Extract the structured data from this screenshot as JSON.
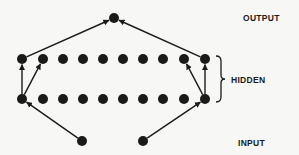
{
  "diagram": {
    "type": "neural-network",
    "labels": {
      "output": "OUTPUT",
      "hidden": "HIDDEN",
      "input": "INPUT"
    },
    "layers": [
      {
        "name": "output",
        "nodes": [
          [
            114,
            18
          ]
        ]
      },
      {
        "name": "hidden-top",
        "nodes": [
          [
            22,
            59
          ],
          [
            43,
            59
          ],
          [
            63,
            59
          ],
          [
            83,
            59
          ],
          [
            103,
            59
          ],
          [
            123,
            59
          ],
          [
            143,
            59
          ],
          [
            163,
            59
          ],
          [
            184,
            59
          ],
          [
            205,
            59
          ]
        ]
      },
      {
        "name": "hidden-bottom",
        "nodes": [
          [
            22,
            99
          ],
          [
            43,
            99
          ],
          [
            63,
            99
          ],
          [
            83,
            99
          ],
          [
            103,
            99
          ],
          [
            123,
            99
          ],
          [
            143,
            99
          ],
          [
            163,
            99
          ],
          [
            184,
            99
          ],
          [
            205,
            99
          ]
        ]
      },
      {
        "name": "input",
        "nodes": [
          [
            82,
            141
          ],
          [
            143,
            141
          ]
        ]
      }
    ],
    "edges": [
      [
        [
          82,
          141
        ],
        [
          22,
          99
        ]
      ],
      [
        [
          143,
          141
        ],
        [
          205,
          99
        ]
      ],
      [
        [
          22,
          99
        ],
        [
          22,
          59
        ]
      ],
      [
        [
          22,
          99
        ],
        [
          43,
          59
        ]
      ],
      [
        [
          205,
          99
        ],
        [
          205,
          59
        ]
      ],
      [
        [
          205,
          99
        ],
        [
          184,
          59
        ]
      ],
      [
        [
          22,
          59
        ],
        [
          114,
          18
        ]
      ],
      [
        [
          205,
          59
        ],
        [
          114,
          18
        ]
      ]
    ],
    "colors": {
      "node": "#1a1a1a",
      "edge": "#1a1a1a",
      "background": "#f7f7f5"
    }
  }
}
